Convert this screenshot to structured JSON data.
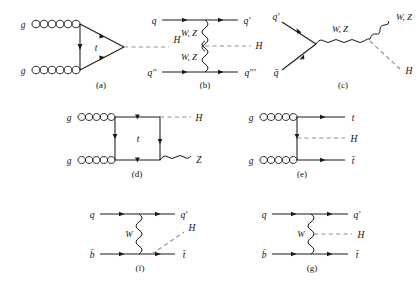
{
  "figure": {
    "background_color": "#ffffff",
    "line_color": "#1a1a1a",
    "higgs_dash_color": "#8f8f8f",
    "panel_count": 7
  },
  "panels": [
    {
      "id": "a",
      "caption": "(a)",
      "process": "gluon-gluon-fusion",
      "incoming": [
        {
          "label": "g",
          "kind": "gluon"
        },
        {
          "label": "g",
          "kind": "gluon"
        }
      ],
      "loop": {
        "label": "t",
        "kind": "fermion-triangle-loop"
      },
      "outgoing": [
        {
          "label": "H",
          "kind": "higgs"
        }
      ]
    },
    {
      "id": "b",
      "caption": "(b)",
      "process": "vector-boson-fusion",
      "incoming": [
        {
          "label": "q",
          "kind": "fermion"
        },
        {
          "label": "q''",
          "kind": "fermion"
        }
      ],
      "mediators": [
        {
          "label": "W, Z",
          "kind": "boson"
        },
        {
          "label": "W, Z",
          "kind": "boson"
        }
      ],
      "outgoing": [
        {
          "label": "q'",
          "kind": "fermion"
        },
        {
          "label": "q'''",
          "kind": "fermion"
        },
        {
          "label": "H",
          "kind": "higgs"
        }
      ]
    },
    {
      "id": "c",
      "caption": "(c)",
      "process": "associated-vector-boson-production",
      "incoming": [
        {
          "label": "q'",
          "kind": "fermion"
        },
        {
          "label": "q̄",
          "kind": "antifermion"
        }
      ],
      "mediators": [
        {
          "label": "W, Z",
          "kind": "boson"
        }
      ],
      "outgoing": [
        {
          "label": "W, Z",
          "kind": "boson"
        },
        {
          "label": "H",
          "kind": "higgs"
        }
      ]
    },
    {
      "id": "d",
      "caption": "(d)",
      "process": "gluon-fusion-box-ZH",
      "incoming": [
        {
          "label": "g",
          "kind": "gluon"
        },
        {
          "label": "g",
          "kind": "gluon"
        }
      ],
      "loop": {
        "label": "t",
        "kind": "fermion-box-loop"
      },
      "outgoing": [
        {
          "label": "H",
          "kind": "higgs"
        },
        {
          "label": "Z",
          "kind": "boson"
        }
      ]
    },
    {
      "id": "e",
      "caption": "(e)",
      "process": "top-quark-associated-production",
      "incoming": [
        {
          "label": "g",
          "kind": "gluon"
        },
        {
          "label": "g",
          "kind": "gluon"
        }
      ],
      "outgoing": [
        {
          "label": "t",
          "kind": "fermion"
        },
        {
          "label": "H",
          "kind": "higgs"
        },
        {
          "label": "t̄",
          "kind": "antifermion"
        }
      ]
    },
    {
      "id": "f",
      "caption": "(f)",
      "process": "single-top-associated-production-higgs-from-top",
      "incoming": [
        {
          "label": "q",
          "kind": "fermion"
        },
        {
          "label": "b̄",
          "kind": "antifermion"
        }
      ],
      "mediators": [
        {
          "label": "W",
          "kind": "boson"
        }
      ],
      "outgoing": [
        {
          "label": "q'",
          "kind": "fermion"
        },
        {
          "label": "H",
          "kind": "higgs"
        },
        {
          "label": "t̄",
          "kind": "antifermion"
        }
      ]
    },
    {
      "id": "g",
      "caption": "(g)",
      "process": "single-top-associated-production-higgs-from-w",
      "incoming": [
        {
          "label": "q",
          "kind": "fermion"
        },
        {
          "label": "b̄",
          "kind": "antifermion"
        }
      ],
      "mediators": [
        {
          "label": "W",
          "kind": "boson"
        }
      ],
      "outgoing": [
        {
          "label": "q'",
          "kind": "fermion"
        },
        {
          "label": "H",
          "kind": "higgs"
        },
        {
          "label": "t̄",
          "kind": "antifermion"
        }
      ]
    }
  ]
}
